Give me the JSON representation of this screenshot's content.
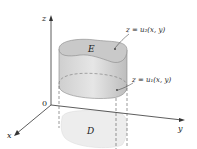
{
  "diagram": {
    "axes": {
      "z_label": "z",
      "x_label": "x",
      "y_label": "y",
      "origin_label": "0"
    },
    "region_solid_label": "E",
    "region_base_label": "D",
    "upper_surface_label": "z = u₂(x, y)",
    "lower_surface_label": "z = u₁(x, y)",
    "colors": {
      "solid_fill": "#d4d4d4",
      "top_fill": "#c4c4c4",
      "base_fill": "#ececec",
      "axis": "#333333"
    }
  }
}
